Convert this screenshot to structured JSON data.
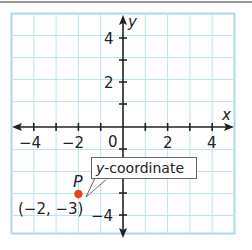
{
  "figure": {
    "x_axis_label": "x",
    "y_axis_label": "y",
    "x_tick_labels": [
      "−4",
      "−2",
      "0",
      "2",
      "4"
    ],
    "y_tick_labels": [
      "4",
      "2",
      "−4"
    ],
    "point": {
      "name": "P",
      "coordinates_label": "(−2, −3)",
      "x": -2,
      "y": -3,
      "color": "#e8431f"
    },
    "callout": {
      "italic_part": "y",
      "rest": "-coordinate"
    },
    "grid_color": "#bfe3ef",
    "axis_color": "#222222",
    "x_range": [
      -5,
      5
    ],
    "y_range": [
      -5,
      5
    ]
  }
}
